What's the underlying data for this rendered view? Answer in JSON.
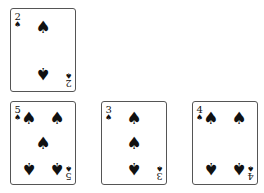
{
  "suit_symbol": "♠",
  "cards": [
    {
      "id": "two",
      "rank": "2",
      "suit": "spades",
      "left": 10,
      "top": 8,
      "pips": [
        {
          "x": 50,
          "y": 22,
          "flip": false
        },
        {
          "x": 50,
          "y": 78,
          "flip": true
        }
      ]
    },
    {
      "id": "five",
      "rank": "5",
      "suit": "spades",
      "left": 10,
      "top": 101,
      "pips": [
        {
          "x": 28,
          "y": 20,
          "flip": false
        },
        {
          "x": 72,
          "y": 20,
          "flip": false
        },
        {
          "x": 50,
          "y": 50,
          "flip": false
        },
        {
          "x": 28,
          "y": 80,
          "flip": true
        },
        {
          "x": 72,
          "y": 80,
          "flip": true
        }
      ]
    },
    {
      "id": "three",
      "rank": "3",
      "suit": "spades",
      "left": 101,
      "top": 101,
      "pips": [
        {
          "x": 50,
          "y": 20,
          "flip": false
        },
        {
          "x": 50,
          "y": 50,
          "flip": false
        },
        {
          "x": 50,
          "y": 80,
          "flip": true
        }
      ]
    },
    {
      "id": "four",
      "rank": "4",
      "suit": "spades",
      "left": 192,
      "top": 101,
      "pips": [
        {
          "x": 28,
          "y": 20,
          "flip": false
        },
        {
          "x": 72,
          "y": 20,
          "flip": false
        },
        {
          "x": 28,
          "y": 80,
          "flip": true
        },
        {
          "x": 72,
          "y": 80,
          "flip": true
        }
      ]
    }
  ]
}
